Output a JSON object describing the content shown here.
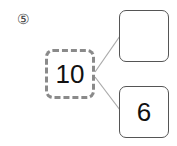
{
  "problem": {
    "number_label": "⑤"
  },
  "number_bond": {
    "whole": "10",
    "parts": [
      "",
      "6"
    ]
  },
  "colors": {
    "dashed_border": "#8a8a8a",
    "solid_border": "#555555",
    "connector": "#aaaaaa"
  }
}
